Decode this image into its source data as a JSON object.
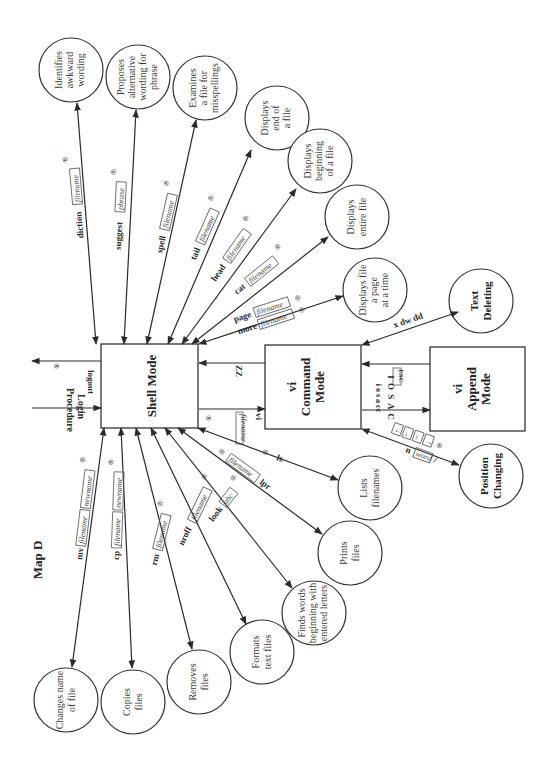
{
  "map_title": "Map D",
  "nodes": {
    "shell_mode": "Shell Mode",
    "vi_command_mode": [
      "vi",
      "Command",
      "Mode"
    ],
    "vi_append_mode": [
      "vi",
      "Append",
      "Mode"
    ],
    "text_deleting": [
      "Text",
      "Deleting"
    ],
    "position_changing": [
      "Position",
      "Changing"
    ]
  },
  "circles": [
    {
      "id": "diction",
      "lines": [
        "Identifies",
        "awkward",
        "wording"
      ],
      "command": "diction",
      "arg": "filename"
    },
    {
      "id": "suggest",
      "lines": [
        "Proposes",
        "alternative",
        "wording for",
        "phrase"
      ],
      "command": "suggest",
      "arg": "phrase"
    },
    {
      "id": "spell",
      "lines": [
        "Examines",
        "a file for",
        "misspellings"
      ],
      "command": "spell",
      "arg": "filename"
    },
    {
      "id": "tail",
      "lines": [
        "Displays",
        "end of",
        "a file"
      ],
      "command": "tail",
      "arg": "filename"
    },
    {
      "id": "head",
      "lines": [
        "Displays",
        "beginning",
        "of a file"
      ],
      "command": "head",
      "arg": "filename"
    },
    {
      "id": "cat",
      "lines": [
        "Displays",
        "entire file"
      ],
      "command": "cat",
      "arg": "filename"
    },
    {
      "id": "page",
      "lines": [
        "Displays file",
        "a page",
        "at a time"
      ],
      "command": "page",
      "arg": "filename",
      "command2": "more",
      "arg2": "filename"
    },
    {
      "id": "mv",
      "lines": [
        "Changes name",
        "of file"
      ],
      "command": "mv",
      "arg": "filename",
      "arg2": "newname"
    },
    {
      "id": "cp",
      "lines": [
        "Copies",
        "files"
      ],
      "command": "cp",
      "arg": "filename",
      "arg2": "newname"
    },
    {
      "id": "rm",
      "lines": [
        "Removes",
        "files"
      ],
      "command": "rm",
      "arg": "filename"
    },
    {
      "id": "nroff",
      "lines": [
        "Formats",
        "text files"
      ],
      "command": "nroff",
      "arg": "filename"
    },
    {
      "id": "look",
      "lines": [
        "Finds words",
        "beginning with",
        "entered letters"
      ],
      "command": "look",
      "arg": "abc"
    },
    {
      "id": "lpr",
      "lines": [
        "Prints",
        "files"
      ],
      "command": "lpr",
      "arg": "filename"
    },
    {
      "id": "ls",
      "lines": [
        "Lists",
        "filenames"
      ],
      "command": "ls"
    }
  ],
  "edges": {
    "login": [
      "Login",
      "Procedure"
    ],
    "logout": "logout",
    "zz": "ZZ",
    "vi_cmd": "vi",
    "vi_arg": "filename",
    "esc": "ESC",
    "append_upper": "I O S A C",
    "append_lower": "i o s a cc",
    "delete_cmds": "x   dw   dd",
    "position_keys": [
      "←",
      "↓",
      "↑",
      "→"
    ],
    "search_cmd": "/",
    "search_arg": "word",
    "search_next": "n"
  },
  "return_key_symbol": "®"
}
